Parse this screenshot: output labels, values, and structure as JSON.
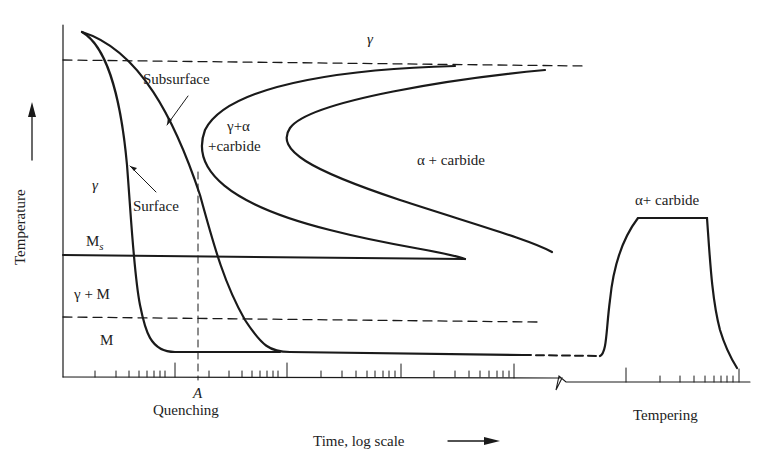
{
  "diagram": {
    "type": "TTT quenching and tempering schematic",
    "axes": {
      "ylabel": "Temperature",
      "xlabel": "Time, log scale",
      "x_marker": "A"
    },
    "sections": {
      "quenching": "Quenching",
      "tempering": "Tempering"
    },
    "regions": {
      "gamma_top": "γ",
      "gamma_left": "γ",
      "gamma_alpha_carbide_1": "γ+α",
      "gamma_alpha_carbide_2": "+carbide",
      "alpha_carbide": "α + carbide",
      "ms": "M",
      "ms_sub": "s",
      "gamma_m": "γ + M",
      "m": "M",
      "tempering_region": "α+ carbide"
    },
    "curves": {
      "subsurface": "Subsurface",
      "surface": "Surface"
    },
    "colors": {
      "line": "#1a1a1a",
      "background": "#ffffff"
    }
  }
}
